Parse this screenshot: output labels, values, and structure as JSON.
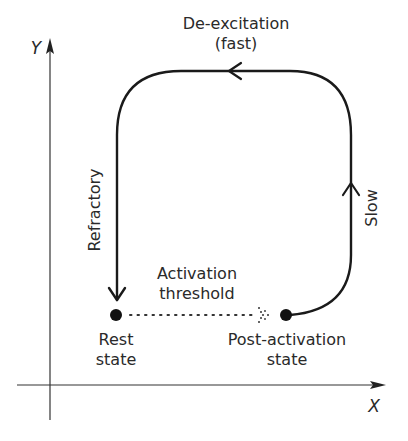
{
  "diagram": {
    "axes": {
      "x_label": "X",
      "y_label": "Y"
    },
    "transitions": {
      "top": {
        "line1": "De-excitation",
        "line2": "(fast)"
      },
      "left": "Refractory",
      "right": "Slow"
    },
    "threshold": {
      "line1": "Activation",
      "line2": "threshold"
    },
    "states": {
      "rest": {
        "line1": "Rest",
        "line2": "state"
      },
      "post": {
        "line1": "Post-activation",
        "line2": "state"
      }
    },
    "colors": {
      "line": "#1a1a1a",
      "text": "#2a2a2a",
      "background": "#ffffff"
    }
  }
}
